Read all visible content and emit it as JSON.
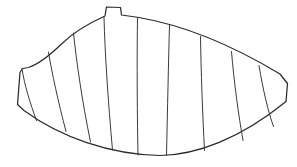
{
  "figure": {
    "type": "technical-line-drawing",
    "canvas": {
      "width": 297,
      "height": 167
    },
    "colors": {
      "background": "#ffffff",
      "outline_stroke": "#2b2b2b",
      "division_stroke": "#3a3a3a",
      "fill": "#ffffff"
    },
    "stroke_widths": {
      "outline": 1.25,
      "division": 1.0
    },
    "outline": {
      "description": "Closed asymmetric shape: short straight left edge, tall concave sweep up to a peaked top with a small square notch, long gently convex top edge sloping down to a blunt angled right tip, and a long concave bottom edge returning to the left corner.",
      "path": "M 22.5 68.5 L 20.0 72.5 L 17.5 104.5 L 24.0 110.5 C 60.0 137.0 110.0 154.5 160.0 155.5 C 196.0 155.0 240.0 139.0 286.0 101.5 L 287.5 83.5 L 280.0 74.0 C 236.0 47.5 188.0 26.0 139.0 17.5 L 121.5 15.0 L 120.5 7.5 L 106.5 7.0 L 105.0 16.0 C 86.0 24.5 72.0 33.5 61.0 44.5 C 49.0 56.0 39.0 64.0 28.5 67.5 Z"
    },
    "division_lines": [
      {
        "name": "division-line-1",
        "path": "M 22.0 69.0 C 24.5 85.0 30.0 103.0 36.5 120.5"
      },
      {
        "name": "division-line-2",
        "path": "M 48.5 52.0 C 52.0 73.5 58.0 101.0 66.0 131.5"
      },
      {
        "name": "division-line-3",
        "path": "M 73.5 33.0 C 76.5 62.0 82.0 100.5 90.5 142.0"
      },
      {
        "name": "division-line-4",
        "path": "M 104.0 17.5 C 105.0 54.0 108.0 100.0 112.5 150.0"
      },
      {
        "name": "division-line-5",
        "path": "M 137.5 17.5 C 137.0 53.5 137.0 103.0 138.0 155.0"
      },
      {
        "name": "division-line-6",
        "path": "M 169.5 25.0 C 168.5 60.5 167.5 110.0 166.5 155.5"
      },
      {
        "name": "division-line-7",
        "path": "M 200.5 36.5 C 201.0 70.5 202.5 113.0 204.5 150.5"
      },
      {
        "name": "division-line-8",
        "path": "M 231.5 51.5 C 234.0 82.0 238.5 115.0 243.0 140.5"
      },
      {
        "name": "division-line-9",
        "path": "M 259.0 65.5 C 263.0 90.0 268.5 113.0 273.5 126.5"
      }
    ],
    "notch": {
      "name": "top-notch",
      "description": "Small rectangular step at the apex of the pattern",
      "x": 106.5,
      "y": 7.0,
      "width": 14.0,
      "height": 8.0
    }
  }
}
